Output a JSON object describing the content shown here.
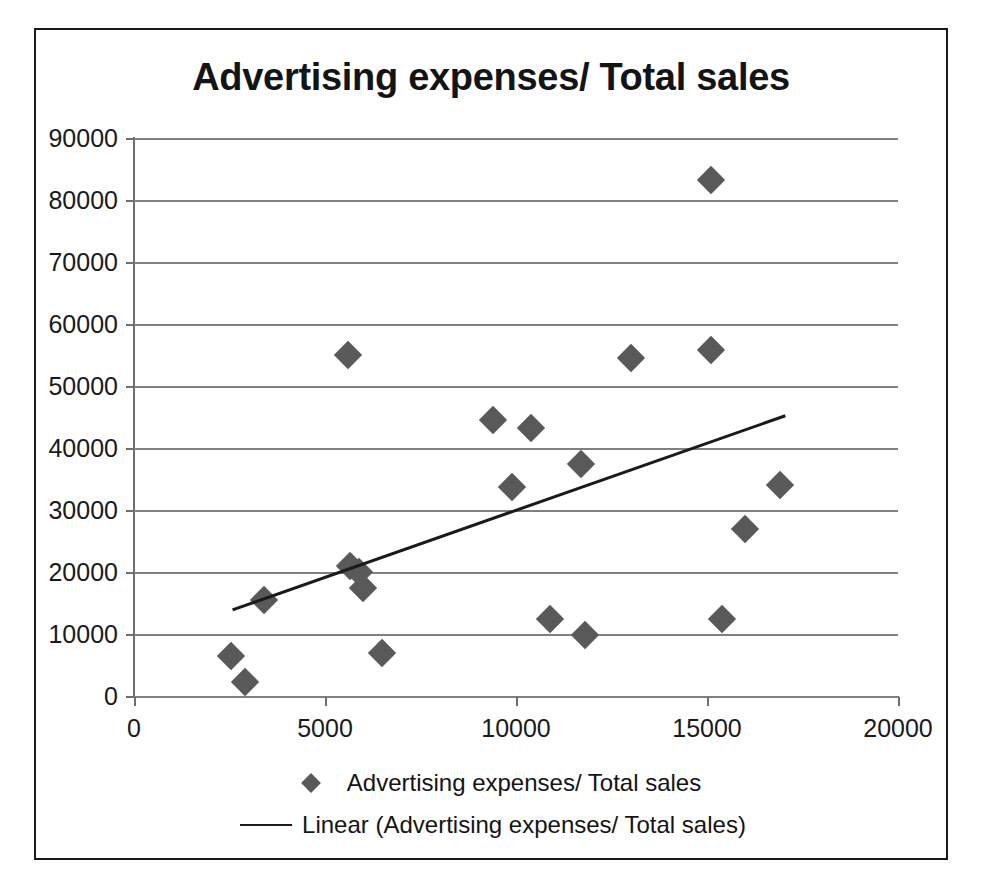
{
  "chart_data": {
    "type": "scatter",
    "title": "Advertising expenses/ Total sales",
    "xlabel": "",
    "ylabel": "",
    "xlim": [
      0,
      20000
    ],
    "ylim": [
      0,
      90000
    ],
    "xticks": [
      0,
      5000,
      10000,
      15000,
      20000
    ],
    "yticks": [
      0,
      10000,
      20000,
      30000,
      40000,
      50000,
      60000,
      70000,
      80000,
      90000
    ],
    "xtick_labels": [
      "0",
      "5000",
      "10000",
      "15000",
      "20000"
    ],
    "ytick_labels": [
      "0",
      "10000",
      "20000",
      "30000",
      "40000",
      "50000",
      "60000",
      "70000",
      "80000",
      "90000"
    ],
    "grid": "horizontal",
    "legend_position": "bottom",
    "marker_color": "#595959",
    "marker_shape": "diamond",
    "trendline_color": "#1a1a1a",
    "series": [
      {
        "name": "Advertising expenses/ Total sales",
        "points": [
          {
            "x": 2550,
            "y": 6400
          },
          {
            "x": 2900,
            "y": 2300
          },
          {
            "x": 3400,
            "y": 15500
          },
          {
            "x": 5600,
            "y": 55000
          },
          {
            "x": 5650,
            "y": 21000
          },
          {
            "x": 5900,
            "y": 20000
          },
          {
            "x": 6000,
            "y": 17400
          },
          {
            "x": 6500,
            "y": 7000
          },
          {
            "x": 9400,
            "y": 44500
          },
          {
            "x": 9900,
            "y": 33700
          },
          {
            "x": 10400,
            "y": 43300
          },
          {
            "x": 10900,
            "y": 12400
          },
          {
            "x": 11700,
            "y": 37500
          },
          {
            "x": 11800,
            "y": 9800
          },
          {
            "x": 13000,
            "y": 54500
          },
          {
            "x": 15100,
            "y": 83300
          },
          {
            "x": 15100,
            "y": 55800
          },
          {
            "x": 15400,
            "y": 12500
          },
          {
            "x": 16000,
            "y": 27000
          },
          {
            "x": 16900,
            "y": 34100
          }
        ]
      }
    ],
    "trendline": {
      "name": "Linear (Advertising expenses/ Total sales)",
      "x_start": 2580,
      "y_start": 13900,
      "x_end": 17050,
      "y_end": 45200
    }
  },
  "legend": {
    "items": [
      {
        "key": "diamond-marker",
        "label": "Advertising expenses/ Total sales"
      },
      {
        "key": "line-marker",
        "label": "Linear (Advertising expenses/ Total sales)"
      }
    ]
  }
}
